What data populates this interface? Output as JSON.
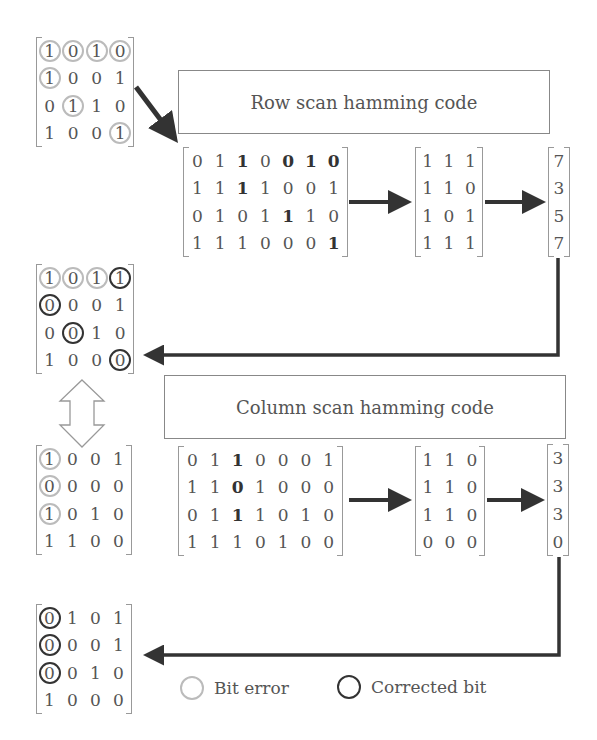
{
  "row_scan": {
    "title": "Row scan hamming code",
    "input": [
      [
        "0",
        "1",
        "1",
        "0",
        "0",
        "1",
        "0"
      ],
      [
        "1",
        "1",
        "1",
        "1",
        "0",
        "0",
        "1"
      ],
      [
        "0",
        "1",
        "0",
        "1",
        "1",
        "1",
        "0"
      ],
      [
        "1",
        "1",
        "1",
        "0",
        "0",
        "0",
        "1"
      ]
    ],
    "bold": [
      [
        0,
        2
      ],
      [
        0,
        4
      ],
      [
        0,
        5
      ],
      [
        0,
        6
      ],
      [
        1,
        2
      ],
      [
        2,
        4
      ],
      [
        3,
        6
      ]
    ],
    "syndrome": [
      [
        "1",
        "1",
        "1"
      ],
      [
        "1",
        "1",
        "0"
      ],
      [
        "1",
        "0",
        "1"
      ],
      [
        "1",
        "1",
        "1"
      ]
    ],
    "result": [
      [
        "7"
      ],
      [
        "3"
      ],
      [
        "5"
      ],
      [
        "7"
      ]
    ]
  },
  "column_scan": {
    "title": "Column scan hamming code",
    "input": [
      [
        "0",
        "1",
        "1",
        "0",
        "0",
        "0",
        "1"
      ],
      [
        "1",
        "1",
        "0",
        "1",
        "0",
        "0",
        "0"
      ],
      [
        "0",
        "1",
        "1",
        "1",
        "0",
        "1",
        "0"
      ],
      [
        "1",
        "1",
        "1",
        "0",
        "1",
        "0",
        "0"
      ]
    ],
    "bold": [
      [
        0,
        2
      ],
      [
        1,
        2
      ],
      [
        2,
        2
      ]
    ],
    "syndrome": [
      [
        "1",
        "1",
        "0"
      ],
      [
        "1",
        "1",
        "0"
      ],
      [
        "1",
        "1",
        "0"
      ],
      [
        "0",
        "0",
        "0"
      ]
    ],
    "result": [
      [
        "3"
      ],
      [
        "3"
      ],
      [
        "3"
      ],
      [
        "0"
      ]
    ]
  },
  "matrices": {
    "original": {
      "values": [
        [
          "1",
          "0",
          "1",
          "0"
        ],
        [
          "1",
          "0",
          "0",
          "1"
        ],
        [
          "0",
          "1",
          "1",
          "0"
        ],
        [
          "1",
          "0",
          "0",
          "1"
        ]
      ],
      "errors": [
        [
          0,
          0
        ],
        [
          0,
          1
        ],
        [
          0,
          2
        ],
        [
          0,
          3
        ],
        [
          1,
          0
        ],
        [
          2,
          1
        ],
        [
          3,
          3
        ]
      ],
      "corrected": []
    },
    "after_row": {
      "values": [
        [
          "1",
          "0",
          "1",
          "1"
        ],
        [
          "0",
          "0",
          "0",
          "1"
        ],
        [
          "0",
          "0",
          "1",
          "0"
        ],
        [
          "1",
          "0",
          "0",
          "0"
        ]
      ],
      "errors": [
        [
          0,
          0
        ],
        [
          0,
          1
        ],
        [
          0,
          2
        ]
      ],
      "corrected": [
        [
          0,
          3
        ],
        [
          1,
          0
        ],
        [
          2,
          1
        ],
        [
          3,
          3
        ]
      ]
    },
    "transposed": {
      "values": [
        [
          "1",
          "0",
          "0",
          "1"
        ],
        [
          "0",
          "0",
          "0",
          "0"
        ],
        [
          "1",
          "0",
          "1",
          "0"
        ],
        [
          "1",
          "1",
          "0",
          "0"
        ]
      ],
      "errors": [
        [
          0,
          0
        ],
        [
          1,
          0
        ],
        [
          2,
          0
        ]
      ],
      "corrected": []
    },
    "final": {
      "values": [
        [
          "0",
          "1",
          "0",
          "1"
        ],
        [
          "0",
          "0",
          "0",
          "1"
        ],
        [
          "0",
          "0",
          "1",
          "0"
        ],
        [
          "1",
          "0",
          "0",
          "0"
        ]
      ],
      "errors": [],
      "corrected": [
        [
          0,
          0
        ],
        [
          1,
          0
        ],
        [
          2,
          0
        ]
      ]
    }
  },
  "legend": {
    "bit_error": "Bit error",
    "corrected_bit": "Corrected bit"
  },
  "colors": {
    "error_ring": "#bbbbbb",
    "corrected_ring": "#333333",
    "arrow": "#333333"
  }
}
